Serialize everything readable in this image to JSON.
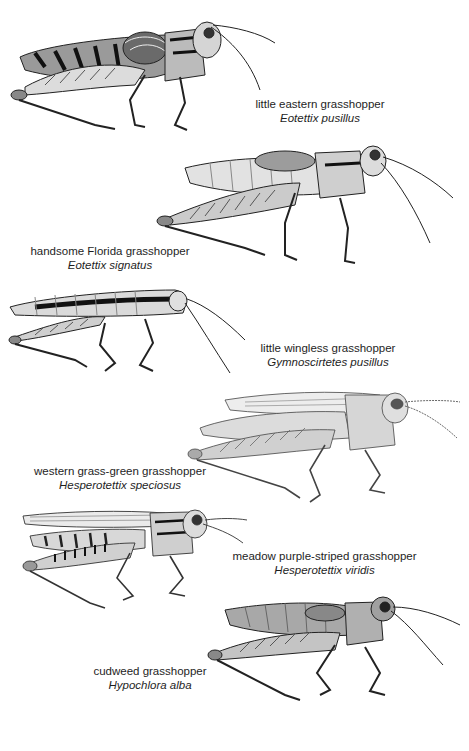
{
  "plate": {
    "species": [
      {
        "id": "little-eastern",
        "common": "little eastern grasshopper",
        "scientific": "Eotettix pusillus",
        "illustration": "grasshopper-illustration-dark-banded-abdomen"
      },
      {
        "id": "handsome-florida",
        "common": "handsome Florida grasshopper",
        "scientific": "Eotettix signatus",
        "illustration": "grasshopper-illustration-pale-abdomen"
      },
      {
        "id": "little-wingless",
        "common": "little wingless grasshopper",
        "scientific": "Gymnoscirtetes pusillus",
        "illustration": "grasshopper-illustration-slender-striped"
      },
      {
        "id": "western-grass-green",
        "common": "western grass-green grasshopper",
        "scientific": "Hesperotettix speciosus",
        "illustration": "grasshopper-illustration-long-winged-pale"
      },
      {
        "id": "meadow-purple-striped",
        "common": "meadow purple-striped grasshopper",
        "scientific": "Hesperotettix viridis",
        "illustration": "grasshopper-illustration-long-winged-marked"
      },
      {
        "id": "cudweed",
        "common": "cudweed grasshopper",
        "scientific": "Hypochlora alba",
        "illustration": "grasshopper-illustration-stout-gray"
      }
    ],
    "footer_caption": ""
  }
}
